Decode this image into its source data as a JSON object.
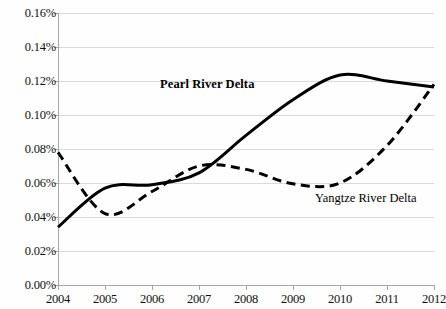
{
  "chart_data": {
    "type": "line",
    "title": "",
    "xlabel": "",
    "ylabel": "",
    "x": [
      2004,
      2005,
      2006,
      2007,
      2008,
      2009,
      2010,
      2011,
      2012
    ],
    "xtick_labels": [
      "2004",
      "2005",
      "2006",
      "2007",
      "2008",
      "2009",
      "2010",
      "2011",
      "2012"
    ],
    "ytick_labels": [
      "0.00%",
      "0.02%",
      "0.04%",
      "0.06%",
      "0.08%",
      "0.10%",
      "0.12%",
      "0.14%",
      "0.16%"
    ],
    "ytick_values": [
      0.0,
      0.02,
      0.04,
      0.06,
      0.08,
      0.1,
      0.12,
      0.14,
      0.16
    ],
    "ylim": [
      0.0,
      0.16
    ],
    "xlim": [
      2004,
      2012
    ],
    "grid": "horizontal",
    "legend_position": "inline-annotation",
    "units": "percent",
    "series": [
      {
        "name": "Pearl River Delta",
        "style": "solid",
        "color": "#000000",
        "line_width": 3,
        "label_bold": true,
        "values": [
          0.034,
          0.057,
          0.059,
          0.066,
          0.088,
          0.109,
          0.1235,
          0.12,
          0.1165
        ]
      },
      {
        "name": "Yangtze River Delta",
        "style": "dashed",
        "color": "#000000",
        "line_width": 3,
        "label_bold": false,
        "values": [
          0.078,
          0.042,
          0.055,
          0.07,
          0.068,
          0.0595,
          0.06,
          0.082,
          0.118
        ]
      }
    ],
    "annotations": [
      {
        "text": "Pearl River Delta",
        "x_px": 160,
        "y_px": 78,
        "bold": true
      },
      {
        "text": "Yangtze River Delta",
        "x_px": 315,
        "y_px": 192,
        "bold": false
      }
    ],
    "colors": {
      "background": "#fefefe",
      "gridline": "#d9d9d9",
      "axis": "#a6a6a6",
      "text": "#111111",
      "series_line": "#000000"
    }
  }
}
